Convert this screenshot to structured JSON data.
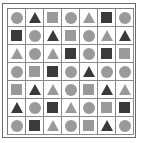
{
  "puzzle": {
    "rows": 7,
    "cols": 7,
    "colors": {
      "light": "#9a9a9a",
      "dark": "#3a3a3a"
    },
    "cells": [
      [
        {
          "shape": "circle",
          "tone": "light"
        },
        {
          "shape": "triangle",
          "tone": "dark"
        },
        {
          "shape": "square",
          "tone": "light"
        },
        {
          "shape": "circle",
          "tone": "light"
        },
        {
          "shape": "triangle",
          "tone": "light"
        },
        {
          "shape": "square",
          "tone": "dark"
        },
        {
          "shape": "circle",
          "tone": "light"
        }
      ],
      [
        {
          "shape": "square",
          "tone": "dark"
        },
        {
          "shape": "circle",
          "tone": "light"
        },
        {
          "shape": "triangle",
          "tone": "dark"
        },
        {
          "shape": "square",
          "tone": "light"
        },
        {
          "shape": "circle",
          "tone": "light"
        },
        {
          "shape": "triangle",
          "tone": "light"
        },
        {
          "shape": "triangle",
          "tone": "dark"
        }
      ],
      [
        {
          "shape": "triangle",
          "tone": "light"
        },
        {
          "shape": "circle",
          "tone": "light"
        },
        {
          "shape": "triangle",
          "tone": "light"
        },
        {
          "shape": "square",
          "tone": "dark"
        },
        {
          "shape": "circle",
          "tone": "light"
        },
        {
          "shape": "square",
          "tone": "dark"
        },
        {
          "shape": "square",
          "tone": "light"
        }
      ],
      [
        {
          "shape": "circle",
          "tone": "light"
        },
        {
          "shape": "square",
          "tone": "light"
        },
        {
          "shape": "square",
          "tone": "dark"
        },
        {
          "shape": "circle",
          "tone": "light"
        },
        {
          "shape": "triangle",
          "tone": "dark"
        },
        {
          "shape": "circle",
          "tone": "light"
        },
        {
          "shape": "circle",
          "tone": "light"
        }
      ],
      [
        {
          "shape": "square",
          "tone": "light"
        },
        {
          "shape": "triangle",
          "tone": "dark"
        },
        {
          "shape": "triangle",
          "tone": "light"
        },
        {
          "shape": "circle",
          "tone": "light"
        },
        {
          "shape": "square",
          "tone": "light"
        },
        {
          "shape": "triangle",
          "tone": "dark"
        },
        {
          "shape": "triangle",
          "tone": "light"
        }
      ],
      [
        {
          "shape": "triangle",
          "tone": "dark"
        },
        {
          "shape": "circle",
          "tone": "light"
        },
        {
          "shape": "square",
          "tone": "dark"
        },
        {
          "shape": "triangle",
          "tone": "light"
        },
        {
          "shape": "circle",
          "tone": "light"
        },
        {
          "shape": "square",
          "tone": "light"
        },
        {
          "shape": "square",
          "tone": "dark"
        }
      ],
      [
        {
          "shape": "circle",
          "tone": "light"
        },
        {
          "shape": "square",
          "tone": "dark"
        },
        {
          "shape": "triangle",
          "tone": "light"
        },
        {
          "shape": "circle",
          "tone": "light"
        },
        {
          "shape": "square",
          "tone": "light"
        },
        {
          "shape": "triangle",
          "tone": "dark"
        },
        {
          "shape": "circle",
          "tone": "light"
        }
      ]
    ]
  }
}
